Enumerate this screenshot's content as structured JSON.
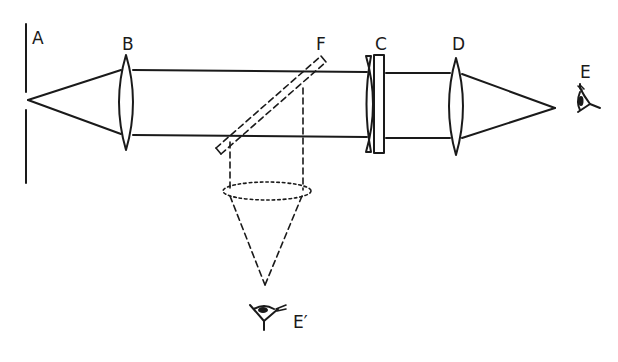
{
  "diagram": {
    "type": "optical-ray-diagram",
    "labels": {
      "a": "A",
      "b": "B",
      "c": "C",
      "d": "D",
      "e": "E",
      "e_prime": "E′",
      "f": "F"
    },
    "components": [
      {
        "id": "A",
        "kind": "screen-with-point-source"
      },
      {
        "id": "B",
        "kind": "biconvex-lens (collimator)"
      },
      {
        "id": "F",
        "kind": "inclined-glass-plate (beam splitter, dashed)"
      },
      {
        "id": "C",
        "kind": "plano-concave lens with plate"
      },
      {
        "id": "D",
        "kind": "biconvex-lens (converging)"
      },
      {
        "id": "E",
        "kind": "eye (observer)"
      },
      {
        "id": "E′",
        "kind": "eye (second observer, via reflection at F)"
      }
    ],
    "colors": {
      "ink": "#1a1a1a",
      "background": "#ffffff"
    }
  }
}
